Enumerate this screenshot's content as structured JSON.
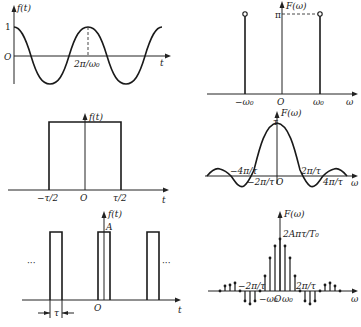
{
  "panels": {
    "cos_time": {
      "y_label": "f(t)",
      "x_label": "t",
      "origin": "O",
      "y_tick": "1",
      "x_tick": "2π/ω₀"
    },
    "cos_spectrum": {
      "y_label": "F(ω)",
      "x_label": "ω",
      "origin": "O",
      "y_tick": "π",
      "x_ticks": [
        "−ω₀",
        "ω₀"
      ]
    },
    "rect_time": {
      "y_label": "f(t)",
      "x_label": "t",
      "origin": "O",
      "x_ticks": [
        "−τ/2",
        "τ/2"
      ]
    },
    "rect_spectrum": {
      "y_label": "F(ω)",
      "x_label": "ω",
      "origin": "O",
      "y_tick": "τ",
      "x_ticks_left": [
        "−4π/τ",
        "−2π/τ"
      ],
      "x_ticks_right": [
        "2π/τ",
        "4π/τ"
      ]
    },
    "pulse_train_time": {
      "y_label": "f(t)",
      "x_label": "t",
      "origin": "O",
      "amplitude": "A",
      "width_label": "τ",
      "period_label": "T₀",
      "ellipsis": "···"
    },
    "pulse_train_spectrum": {
      "y_label": "F(ω)",
      "x_label": "ω",
      "peak_label": "2Aπτ/T₀",
      "x_ticks_left": [
        "−2π/τ",
        "−ω₀"
      ],
      "origin": "O",
      "x_ticks_right": [
        "ω₀",
        "2π/τ"
      ]
    }
  }
}
